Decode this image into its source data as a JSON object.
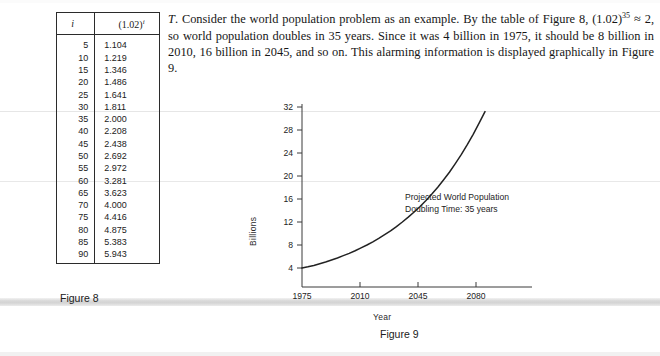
{
  "paragraph": {
    "lead_italic": "T",
    "text": ". Consider the world population problem as an example. By the table of Figure 8, (1.02)35 ≈ 2, so world population doubles in 35 years. Since it was 4 billion in 1975, it should be 8 billion in 2010, 16 billion in 2045, and so on. This alarming information is displayed graphically in Figure 9.",
    "seg1": ". Consider the world population problem as an example. By the table of Figure 8, (1.02)",
    "exponent": "35",
    "seg2": " ≈ 2, so world population doubles in 35 years. Since it was 4 billion in 1975, it should be 8 billion in 2010, 16 billion in 2045, and so on. This alarming information is displayed graphically in Figure 9."
  },
  "table": {
    "caption": "Figure 8",
    "headers": [
      "i",
      "(1.02)",
      "i"
    ],
    "header_base": "(1.02)",
    "header_exp": "i",
    "header_i": "i",
    "rows": [
      {
        "i": "5",
        "v": "1.104"
      },
      {
        "i": "10",
        "v": "1.219"
      },
      {
        "i": "15",
        "v": "1.346"
      },
      {
        "i": "20",
        "v": "1.486"
      },
      {
        "i": "25",
        "v": "1.641"
      },
      {
        "i": "30",
        "v": "1.811"
      },
      {
        "i": "35",
        "v": "2.000"
      },
      {
        "i": "40",
        "v": "2.208"
      },
      {
        "i": "45",
        "v": "2.438"
      },
      {
        "i": "50",
        "v": "2.692"
      },
      {
        "i": "55",
        "v": "2.972"
      },
      {
        "i": "60",
        "v": "3.281"
      },
      {
        "i": "65",
        "v": "3.623"
      },
      {
        "i": "70",
        "v": "4.000"
      },
      {
        "i": "75",
        "v": "4.416"
      },
      {
        "i": "80",
        "v": "4.875"
      },
      {
        "i": "85",
        "v": "5.383"
      },
      {
        "i": "90",
        "v": "5.943"
      }
    ]
  },
  "figure9": {
    "caption": "Figure 9",
    "annotation_line1": "Projected World Population",
    "annotation_line2": "Doubling Time:  35 years"
  },
  "chart_data": {
    "type": "line",
    "title": "",
    "xlabel": "Year",
    "ylabel": "Billions",
    "x_tick_labels": [
      "1975",
      "2010",
      "2045",
      "2080"
    ],
    "x_tick_values": [
      1975,
      2010,
      2045,
      2080
    ],
    "y_tick_labels": [
      "4",
      "8",
      "12",
      "16",
      "20",
      "24",
      "28",
      "32"
    ],
    "y_tick_values": [
      4,
      8,
      12,
      16,
      20,
      24,
      28,
      32
    ],
    "xlim": [
      1975,
      2115
    ],
    "ylim": [
      0,
      34
    ],
    "grid": false,
    "legend": "none",
    "annotations": [
      "Projected World Population",
      "Doubling Time:  35 years"
    ],
    "series": [
      {
        "name": "Projected World Population",
        "color": "#222222",
        "x": [
          1975,
          1985,
          1995,
          2005,
          2010,
          2020,
          2030,
          2040,
          2045,
          2055,
          2065,
          2075,
          2080,
          2090,
          2100,
          2105
        ],
        "y": [
          4.0,
          4.4,
          5.0,
          5.7,
          6.0,
          6.8,
          7.6,
          8.7,
          9.2,
          10.4,
          11.8,
          13.4,
          14.2,
          16.1,
          18.3,
          19.5
        ]
      }
    ],
    "curve_points": "4,4.2,4.45,4.75,5.05,5.4,5.75,6.15,6.55,7.0,7.5,8.0,8.55,9.15,9.8,10.45,11.2,12.0,12.85,13.75,14.7,15.75,16.85,18.05,19.35,20.7,22.2,23.75,25.45,27.25,29.2,31.2"
  },
  "colors": {
    "ink": "#1a1a1a",
    "curve": "#222222",
    "axis": "#3a3a3a",
    "scan_band": "#d9d9d9"
  }
}
